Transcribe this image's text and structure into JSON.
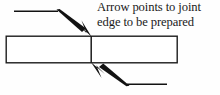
{
  "diagram": {
    "title_annotation": {
      "line1": "Arrow points to joint",
      "line2": "edge to be prepared"
    },
    "colors": {
      "ink": "#121212",
      "outline": "#1c1c1c",
      "background": "#fefefe",
      "fill": "#ffffff"
    },
    "workpiece": {
      "label": "workpiece-rectangle",
      "x": 6,
      "y": 36,
      "width": 171,
      "height": 27
    },
    "joint": {
      "label": "joint-edge-line",
      "x": 91,
      "y_top": 36,
      "y_bottom": 63
    },
    "arrows": [
      {
        "name": "upper-arrow",
        "direction": "down-right",
        "leader_start_x": 14,
        "leader_y": 11,
        "bend_x": 57,
        "tip_x": 91,
        "tip_y": 36
      },
      {
        "name": "lower-arrow",
        "direction": "up-left",
        "leader_start_x": 167,
        "leader_y": 84,
        "bend_x": 128,
        "tip_x": 92,
        "tip_y": 63
      }
    ]
  }
}
